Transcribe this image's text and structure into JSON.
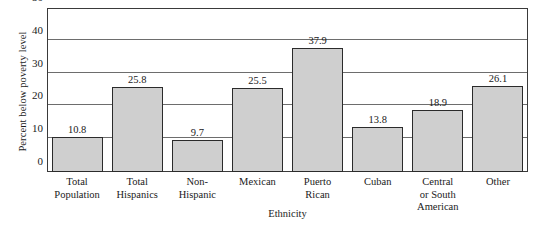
{
  "chart_data": {
    "type": "bar",
    "title": "",
    "xlabel": "Ethnicity",
    "ylabel": "Percent below poverty level",
    "ylim": [
      0,
      50
    ],
    "yticks": [
      0,
      10,
      20,
      30,
      40,
      50
    ],
    "grid": true,
    "legend": "none",
    "bar_fill_color": "#cfcfcf",
    "bar_border_color": "#2b2b2b",
    "categories": [
      "Total Population",
      "Total Hispanics",
      "Non-Hispanic",
      "Mexican",
      "Puerto Rican",
      "Cuban",
      "Central or South American",
      "Other"
    ],
    "category_lines": [
      [
        "Total",
        "Population"
      ],
      [
        "Total",
        "Hispanics"
      ],
      [
        "Non-",
        "Hispanic"
      ],
      [
        "Mexican"
      ],
      [
        "Puerto",
        "Rican"
      ],
      [
        "Cuban"
      ],
      [
        "Central",
        "or South",
        "American"
      ],
      [
        "Other"
      ]
    ],
    "values": [
      10.8,
      25.8,
      9.7,
      25.5,
      37.9,
      13.8,
      18.9,
      26.1
    ],
    "value_labels": [
      "10.8",
      "25.8",
      "9.7",
      "25.5",
      "37.9",
      "13.8",
      "18.9",
      "26.1"
    ]
  },
  "axis": {
    "y_title": "Percent below poverty level",
    "x_title": "Ethnicity",
    "ytick_labels": [
      "50",
      "40",
      "30",
      "20",
      "10",
      "0"
    ]
  }
}
